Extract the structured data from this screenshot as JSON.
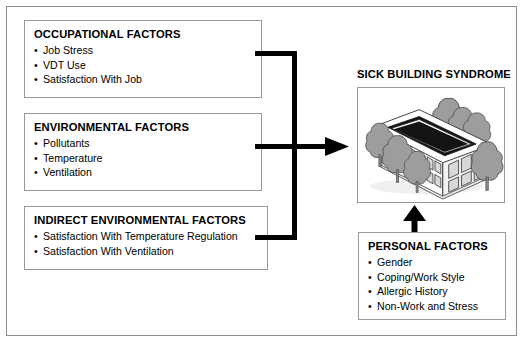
{
  "diagram": {
    "colors": {
      "box_border": "#9a9a9a",
      "frame_border": "#8d8d8d",
      "arrow": "#000000",
      "illustration_gray": "#9d9d9d",
      "text": "#000000"
    },
    "boxes": [
      {
        "id": "occupational",
        "title": "OCCUPATIONAL FACTORS",
        "items": [
          "Job Stress",
          "VDT Use",
          "Satisfaction With Job"
        ]
      },
      {
        "id": "environmental",
        "title": "ENVIRONMENTAL FACTORS",
        "items": [
          "Pollutants",
          "Temperature",
          "Ventilation"
        ]
      },
      {
        "id": "indirect",
        "title": "INDIRECT ENVIRONMENTAL FACTORS",
        "items": [
          "Satisfaction With Temperature Regulation",
          "Satisfaction With Ventilation"
        ]
      },
      {
        "id": "personal",
        "title": "PERSONAL FACTORS",
        "items": [
          "Gender",
          "Coping/Work Style",
          "Allergic History",
          "Non-Work and Stress"
        ]
      }
    ],
    "outcome": {
      "title": "SICK BUILDING SYNDROME",
      "illustration": "isometric-office-building-with-trees"
    },
    "bullet_glyph": "•",
    "connectors": [
      {
        "id": "factors-to-outcome",
        "from": [
          "occupational",
          "environmental",
          "indirect"
        ],
        "to": "outcome",
        "style": "comb-bracket-right-arrow"
      },
      {
        "id": "personal-to-outcome",
        "from": [
          "personal"
        ],
        "to": "outcome",
        "style": "up-arrow"
      }
    ]
  }
}
